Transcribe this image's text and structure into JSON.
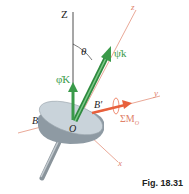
{
  "figure": {
    "caption": "Fig. 18.31",
    "labels": {
      "Z_axis": "Z",
      "z_axis": "z",
      "y_axis": "y",
      "x_axis": "x",
      "theta": "θ",
      "psi_dot_k": "ψ̇k",
      "phi_dot_K": "φ̇K",
      "origin": "O",
      "B": "B",
      "B_prime": "B′",
      "sum_moment": "ΣM",
      "sum_moment_sub": "O"
    },
    "colors": {
      "axis_black": "#222222",
      "axis_orange": "#e0826a",
      "vector_green": "#3a9a4a",
      "moment_orange": "#e8603c",
      "disc_top": "#c9d3da",
      "disc_side": "#8e9aa3",
      "shaft": "#9aa4ab"
    }
  }
}
